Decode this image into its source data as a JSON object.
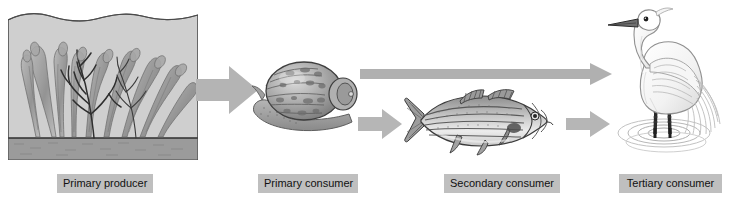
{
  "diagram": {
    "width": 732,
    "height": 206,
    "background_color": "#ffffff"
  },
  "palette": {
    "label_background": "#bfbfbf",
    "label_text": "#111111",
    "arrow_fill": "#b4b4b4",
    "arrow_fill_light": "#c3c3c3",
    "water_fill": "#cfcfcf",
    "sediment_fill": "#9a9a9a",
    "kelp_stroke": "#6f6f6f",
    "kelp_dark_stroke": "#3a3a3a",
    "panel_border": "#4a4a4a",
    "ink": "#555555",
    "ink_dark": "#2c2c2c"
  },
  "levels": [
    {
      "id": "primary-producer",
      "label": "Primary producer",
      "organism": "kelp-seaweed",
      "label_left": 57,
      "label_top": 174,
      "label_width": 84
    },
    {
      "id": "primary-consumer",
      "label": "Primary consumer",
      "organism": "snail",
      "label_left": 258,
      "label_top": 174,
      "label_width": 88
    },
    {
      "id": "secondary-consumer",
      "label": "Secondary consumer",
      "organism": "striped-bass-fish",
      "label_left": 444,
      "label_top": 174,
      "label_width": 104
    },
    {
      "id": "tertiary-consumer",
      "label": "Tertiary consumer",
      "organism": "egret-heron-bird",
      "label_left": 619,
      "label_top": 174,
      "label_width": 91
    }
  ],
  "arrows": [
    {
      "id": "producer-to-primary",
      "from": "primary-producer",
      "to": "primary-consumer",
      "style": "thick-block",
      "direction": "right"
    },
    {
      "id": "primary-to-tertiary",
      "from": "primary-consumer",
      "to": "tertiary-consumer",
      "style": "long-thin",
      "direction": "right"
    },
    {
      "id": "primary-to-secondary",
      "from": "primary-consumer",
      "to": "secondary-consumer",
      "style": "short-block",
      "direction": "right"
    },
    {
      "id": "secondary-to-tertiary",
      "from": "secondary-consumer",
      "to": "tertiary-consumer",
      "style": "short-block",
      "direction": "right"
    }
  ]
}
